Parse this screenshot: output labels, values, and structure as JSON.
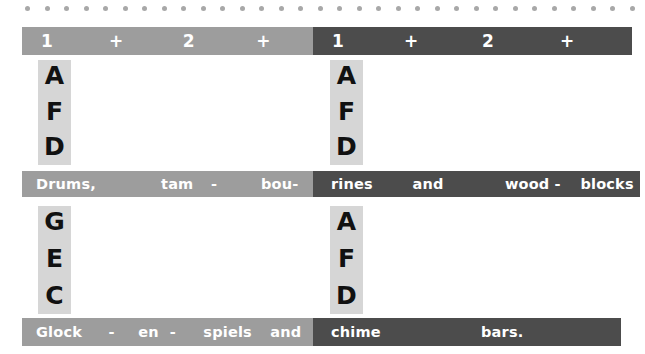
{
  "decor": {
    "dot_color": "#a8a8a8",
    "dot_count": 32,
    "dot_start_x": 25,
    "dot_spacing": 19.5
  },
  "colors": {
    "light_bar": "#9d9d9d",
    "dark_bar": "#4c4c4c",
    "note_block": "#d6d6d6",
    "bar_text": "#ffffff",
    "note_text": "#111111",
    "page_background": "#ffffff"
  },
  "count_bars": {
    "left": {
      "shade": "light",
      "cells": [
        "1",
        "+",
        "2",
        "+"
      ]
    },
    "right": {
      "shade": "dark",
      "cells": [
        "1",
        "+",
        "2",
        "+"
      ]
    }
  },
  "rows": [
    {
      "note_block_left": {
        "letters": [
          "A",
          "F",
          "D"
        ]
      },
      "note_block_right": {
        "letters": [
          "A",
          "F",
          "D"
        ]
      },
      "lyric_left": {
        "shade": "light",
        "cells": [
          "Drums,",
          "tam",
          "-",
          "bou-"
        ]
      },
      "lyric_right": {
        "shade": "dark",
        "cells": [
          "rines",
          "and",
          "wood -",
          "blocks"
        ]
      }
    },
    {
      "note_block_left": {
        "letters": [
          "G",
          "E",
          "C"
        ]
      },
      "note_block_right": {
        "letters": [
          "A",
          "F",
          "D"
        ]
      },
      "lyric_left": {
        "shade": "light",
        "cells": [
          "Glock",
          "-",
          "en",
          "-",
          "spiels",
          "and"
        ]
      },
      "lyric_right": {
        "shade": "dark",
        "cells": [
          "chime",
          "bars."
        ]
      }
    }
  ]
}
